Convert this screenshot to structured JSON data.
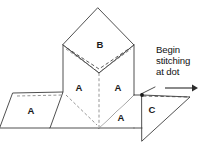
{
  "figure": {
    "background_color": "#ffffff",
    "line_color": "#3c3c3c",
    "fold_line_color": "#8a8a8a",
    "labels": {
      "top_face": "B",
      "left_upright_face": "A",
      "right_upright_face": "A",
      "left_flap": "A",
      "bottom_right_flap": "A",
      "right_triangle": "C"
    },
    "callout": {
      "line1": "Begin",
      "line2": "stitching",
      "line3": "at dot"
    },
    "marker": {
      "dot_label": "stitch-start-dot",
      "dot_x": 142,
      "dot_y": 95,
      "dot_color": "#1a1a1a"
    },
    "arrow": {
      "direction": "right",
      "x_start": 165,
      "x_end": 196,
      "y": 88,
      "color": "#2b2b2b"
    }
  }
}
